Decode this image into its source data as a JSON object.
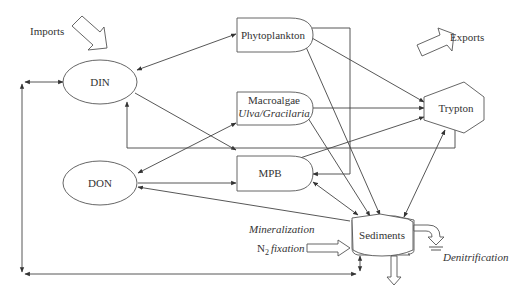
{
  "diagram": {
    "nodes": {
      "din": {
        "label": "DIN",
        "shape": "ellipse"
      },
      "don": {
        "label": "DON",
        "shape": "ellipse"
      },
      "phytoplankton": {
        "label": "Phytoplankton",
        "shape": "rounded-box"
      },
      "macroalgae": {
        "label": "Macroalgae",
        "sublabel": "Ulva/Gracilaria",
        "shape": "rounded-box"
      },
      "mpb": {
        "label": "MPB",
        "shape": "rounded-box"
      },
      "trypton": {
        "label": "Trypton",
        "shape": "hexagon"
      },
      "sediments": {
        "label": "Sediments",
        "shape": "barrel"
      }
    },
    "annotations": {
      "imports": "Imports",
      "exports": "Exports",
      "mineralization": "Mineralization",
      "n2_prefix": "N",
      "n2_sub": "2",
      "n2_fixation": "fixation",
      "denitrification": "Denitrification"
    },
    "edges": [
      {
        "from": "din",
        "to": "phytoplankton",
        "bidirectional": true
      },
      {
        "from": "din",
        "to": "mpb"
      },
      {
        "from": "don",
        "to": "macroalgae",
        "bidirectional": true
      },
      {
        "from": "don",
        "to": "mpb"
      },
      {
        "from": "sediments",
        "to": "don"
      },
      {
        "from": "phytoplankton",
        "to": "trypton"
      },
      {
        "from": "phytoplankton",
        "to": "sediments"
      },
      {
        "from": "phytoplankton",
        "to": "mpb"
      },
      {
        "from": "macroalgae",
        "to": "trypton"
      },
      {
        "from": "macroalgae",
        "to": "sediments"
      },
      {
        "from": "mpb",
        "to": "trypton"
      },
      {
        "from": "mpb",
        "to": "din"
      },
      {
        "from": "mpb",
        "to": "sediments",
        "bidirectional": true
      },
      {
        "from": "sediments",
        "to": "trypton",
        "bidirectional": true
      },
      {
        "from": "sediments",
        "to": "din",
        "bidirectional": true,
        "via": "left boundary loop"
      }
    ]
  }
}
